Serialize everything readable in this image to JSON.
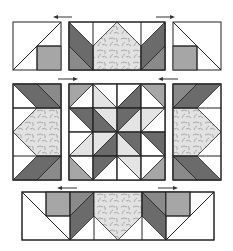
{
  "diagram": {
    "unit_px": 24,
    "colors": {
      "white": "#ffffff",
      "light": "#e4e4e4",
      "medium": "#a6a6a6",
      "dark": "#6b6b6b",
      "print": "#dadada",
      "line": "#222222"
    },
    "rows": [
      {
        "name": "top-row",
        "blocks": [
          "corner-unit-left",
          "side-unit-horizontal-top",
          "corner-unit-right"
        ],
        "arrows": [
          "left",
          "right"
        ]
      },
      {
        "name": "middle-row",
        "blocks": [
          "side-unit-vertical-left",
          "center-star-block",
          "side-unit-vertical-right"
        ],
        "arrows": [
          "right",
          "left"
        ]
      },
      {
        "name": "bottom-row",
        "blocks": [
          "bottom-border-unit"
        ],
        "arrows": [
          "left",
          "right"
        ]
      }
    ],
    "center_grid": [
      [
        "medium/white BL-TR",
        "white/light TL-BR",
        "white/dark BL-TR",
        "medium/white TL-BR"
      ],
      [
        "dark/white TL-BR",
        "light/dark TL-BR",
        "dark/light BL-TR",
        "light/white BL-TR"
      ],
      [
        "white/light BL-TR",
        "light/dark BL-TR",
        "dark/light TL-BR",
        "dark/white TL-BR"
      ],
      [
        "white/medium TL-BR",
        "dark/white BL-TR",
        "light/white TL-BR",
        "white/medium BL-TR"
      ]
    ]
  }
}
